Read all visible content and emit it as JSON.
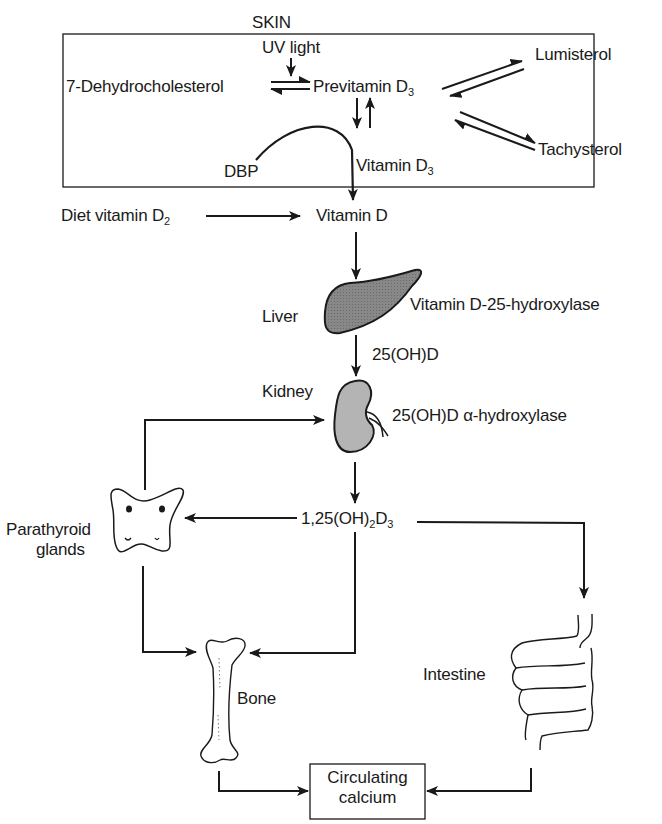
{
  "diagram": {
    "type": "vitamin-d-metabolism-pathway",
    "skin_box": {
      "title": "SKIN",
      "uv": "UV light",
      "precursor": "7-Dehydrocholesterol",
      "previtamin": {
        "text": "Previtamin D",
        "sub": "3"
      },
      "lumisterol": "Lumisterol",
      "tachysterol": "Tachysterol",
      "vitamin_d3": {
        "text": "Vitamin D",
        "sub": "3"
      }
    },
    "dbp": "DBP",
    "diet": {
      "text": "Diet vitamin D",
      "sub": "2"
    },
    "vitamin_d": "Vitamin D",
    "liver": {
      "label": "Liver",
      "enzyme": "Vitamin D-25-hydroxylase"
    },
    "metabolite_25": "25(OH)D",
    "kidney": {
      "label": "Kidney",
      "enzyme": "25(OH)D α-hydroxylase"
    },
    "calcitriol": {
      "a": "1,25(OH)",
      "sub1": "2",
      "b": "D",
      "sub2": "3"
    },
    "parathyroid": {
      "line1": "Parathyroid",
      "line2": "glands"
    },
    "bone": "Bone",
    "intestine": "Intestine",
    "circulating": {
      "line1": "Circulating",
      "line2": "calcium"
    }
  },
  "colors": {
    "ink": "#1a1a1a",
    "organ_fill_liver": "#7a7a7a",
    "organ_fill_kidney": "#a8a8a8",
    "background": "#ffffff"
  }
}
